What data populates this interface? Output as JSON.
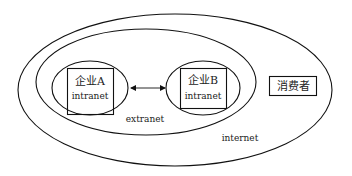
{
  "diagram": {
    "regions": {
      "internet": {
        "label": "internet"
      },
      "extranet": {
        "label": "extranet"
      }
    },
    "nodes": [
      {
        "id": "enterprise-a",
        "title": "企业A",
        "sublabel": "intranet"
      },
      {
        "id": "enterprise-b",
        "title": "企业B",
        "sublabel": "intranet"
      },
      {
        "id": "consumer",
        "title": "消费者"
      }
    ],
    "edges": [
      {
        "from": "enterprise-a",
        "to": "enterprise-b",
        "type": "bidirectional-arrow"
      }
    ],
    "colors": {
      "stroke": "#111111",
      "background": "#ffffff",
      "text": "#222222"
    }
  }
}
